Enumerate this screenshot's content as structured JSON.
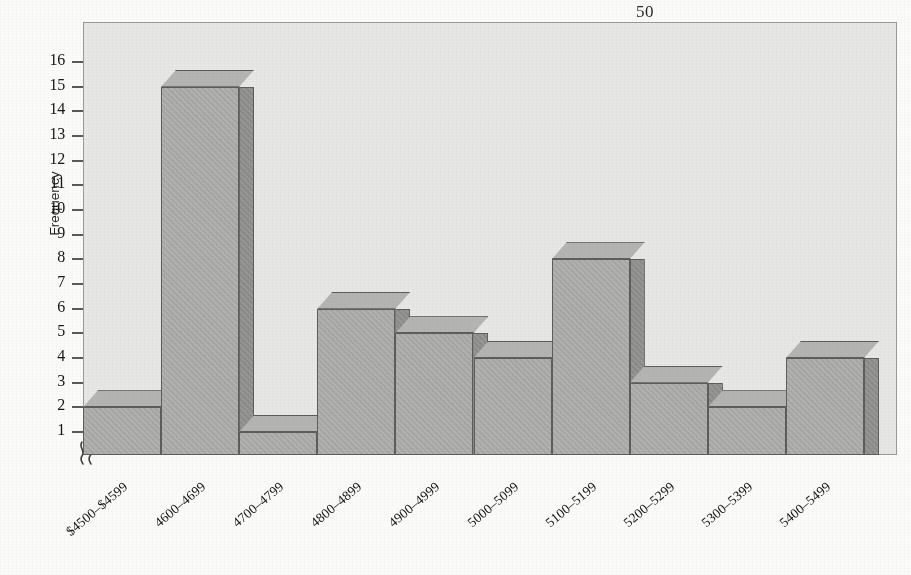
{
  "page": {
    "number": "50"
  },
  "figure": {
    "name": "income-frequency-histogram"
  },
  "axes": {
    "y_title": "Frequency",
    "y_ticks": [
      "16",
      "15",
      "14",
      "13",
      "12",
      "11",
      "10",
      "9",
      "8",
      "7",
      "6",
      "5",
      "4",
      "3",
      "2",
      "1"
    ],
    "axis_break_symbol": "axis-break-squiggle"
  },
  "colors": {
    "page_background": "#fbfbfa",
    "plot_background": "#e8e8e6",
    "bar_front": "#a9a9a7",
    "bar_top": "#b4b4b2",
    "bar_side": "#8f8f8d",
    "bar_outline": "#5d5d5b",
    "text": "#161616"
  },
  "chart_data": {
    "type": "bar",
    "title": "",
    "xlabel": "",
    "ylabel": "Frequency",
    "categories": [
      "$4500–$4599",
      "4600–4699",
      "4700–4799",
      "4800–4899",
      "4900–4999",
      "5000–5099",
      "5100–5199",
      "5200–5299",
      "5300–5399",
      "5400–5499"
    ],
    "values": [
      2,
      15,
      1,
      6,
      5,
      4,
      8,
      3,
      2,
      4
    ],
    "ylim": [
      0,
      16
    ],
    "ytick_values": [
      1,
      2,
      3,
      4,
      5,
      6,
      7,
      8,
      9,
      10,
      11,
      12,
      13,
      14,
      15,
      16
    ],
    "grid": false,
    "legend": null,
    "y_axis_broken": true,
    "style": "3d-bars"
  }
}
